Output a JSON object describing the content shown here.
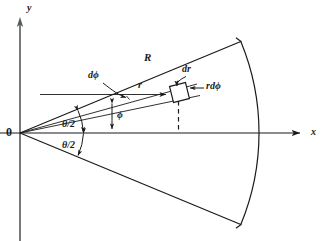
{
  "figure": {
    "background_color": "#ffffff",
    "line_color": "#1a1a1a",
    "axes": {
      "y_label": "y",
      "x_label": "x",
      "origin_label": "0"
    },
    "labels": {
      "radius_R": "R",
      "radius_r": "r",
      "differential_r": "dr",
      "differential_phi": "dϕ",
      "arc_element": "rdϕ",
      "angle_phi": "ϕ",
      "half_angle_upper": "θ/2",
      "half_angle_lower": "θ/2"
    },
    "geometry": {
      "origin": [
        20,
        133
      ],
      "sector_radius": 239,
      "half_angle_degrees": 22.5,
      "element_radius": 158,
      "element_angle_degrees": 17.5,
      "x_axis_end": [
        306,
        133
      ],
      "y_axis_top": [
        20,
        18
      ],
      "arc_x_intercept": [
        259,
        133
      ],
      "upper_corner": [
        238,
        37
      ],
      "lower_corner": [
        238,
        234
      ]
    }
  }
}
